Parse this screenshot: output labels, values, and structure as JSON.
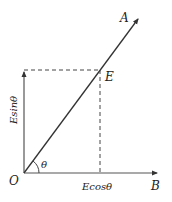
{
  "diagram": {
    "labels": {
      "A": "A",
      "B": "B",
      "E": "E",
      "O": "O",
      "theta": "θ",
      "vertical_component": "Esinθ",
      "horizontal_component": "Ecosθ"
    },
    "colors": {
      "line": "#333333",
      "axis": "#555555",
      "background": "#ffffff"
    }
  }
}
